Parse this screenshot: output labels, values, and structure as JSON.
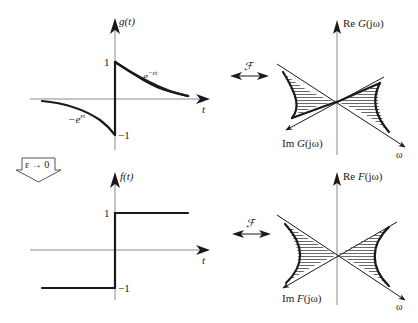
{
  "figure": {
    "top_left": {
      "y_label_fn": "g",
      "y_label_arg": "(t)",
      "x_label": "t",
      "tick_pos": "1",
      "tick_neg": "−1",
      "right_curve_label_base": "e",
      "right_curve_label_exp": "−εt",
      "left_curve_label_base": "−e",
      "left_curve_label_exp": "εt"
    },
    "top_right": {
      "re_axis_label_pre": "Re ",
      "re_axis_label_fn": "G",
      "re_axis_label_arg": "(jω)",
      "im_axis_label_pre": "Im ",
      "im_axis_label_fn": "G",
      "im_axis_label_arg": "(jω)",
      "omega_label": "ω",
      "transform_symbol": "ℱ"
    },
    "limit_arrow": {
      "label": "ε → 0"
    },
    "bottom_left": {
      "y_label_fn": "f",
      "y_label_arg": "(t)",
      "x_label": "t",
      "tick_pos": "1",
      "tick_neg": "−1"
    },
    "bottom_right": {
      "re_axis_label_pre": "Re ",
      "re_axis_label_fn": "F",
      "re_axis_label_arg": "(jω)",
      "im_axis_label_pre": "Im ",
      "im_axis_label_fn": "F",
      "im_axis_label_arg": "(jω)",
      "omega_label": "ω",
      "transform_symbol": "ℱ"
    }
  },
  "colors": {
    "ink": "#1a1a1a",
    "axis": "#8a8a8a",
    "background": "#ffffff"
  }
}
